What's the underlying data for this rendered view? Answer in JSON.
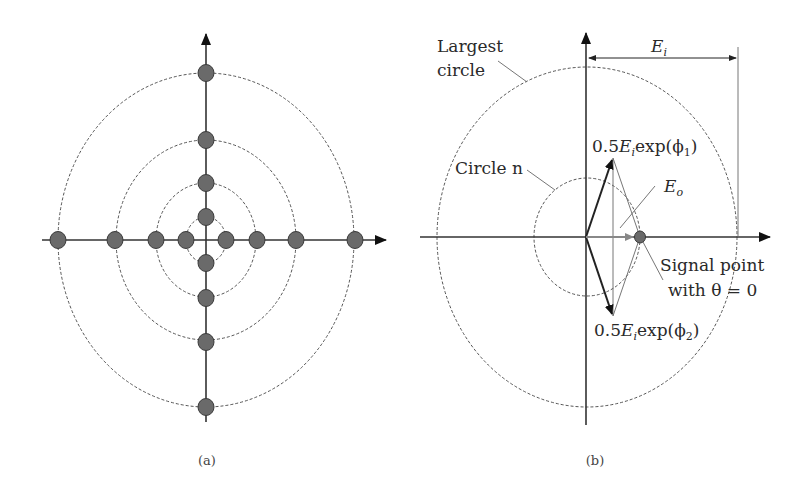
{
  "panels": [
    {
      "id": "a",
      "caption": "(a)",
      "description": "Constellation of signal points on concentric dashed circles along real and imaginary axes",
      "circles": [
        {
          "rx": 20,
          "ry": 23
        },
        {
          "rx": 50,
          "ry": 57
        },
        {
          "rx": 90,
          "ry": 100
        },
        {
          "rx": 148,
          "ry": 167
        }
      ],
      "points_per_circle": 4
    },
    {
      "id": "b",
      "caption": "(b)",
      "labels": {
        "largest_circle_line1": "Largest",
        "largest_circle_line2": "circle",
        "circle_n": "Circle n",
        "ei_main": "E",
        "ei_sub": "i",
        "eo_main": "E",
        "eo_sub": "o",
        "vec1_prefix": "0.5",
        "vec1_E": "E",
        "vec1_sub": "i",
        "vec1_suffix": "exp(ϕ",
        "vec1_index": "1",
        "vec1_close": ")",
        "vec2_prefix": "0.5",
        "vec2_E": "E",
        "vec2_sub": "i",
        "vec2_suffix": "exp(ϕ",
        "vec2_index": "2",
        "vec2_close": ")",
        "signal_line1": "Signal point",
        "signal_line2": "with θ = 0"
      }
    }
  ],
  "colors": {
    "line": "#333333",
    "dot": "#6a6a6a",
    "vector_eo": "#888888"
  }
}
